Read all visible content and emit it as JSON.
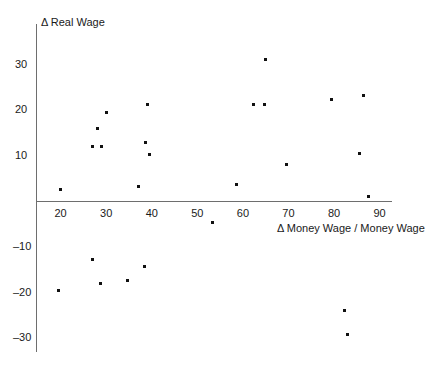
{
  "chart_data": {
    "type": "scatter",
    "title": "",
    "xlabel": "Δ Money Wage / Money Wage",
    "ylabel": "Δ Real Wage",
    "xlim": [
      13,
      95
    ],
    "ylim": [
      -34,
      35
    ],
    "xticks": [
      20,
      30,
      40,
      50,
      60,
      70,
      80,
      90
    ],
    "xtick_labels": [
      "20",
      "30",
      "40",
      "50",
      "60",
      "70",
      "80",
      "90"
    ],
    "yticks": [
      30,
      20,
      10,
      -10,
      -20,
      -30
    ],
    "ytick_labels": [
      "30",
      "20",
      "10",
      "–10",
      "–20",
      "–30"
    ],
    "grid": false,
    "legend": null,
    "marker_color": "#111111",
    "axis_color": "#6e6e6e",
    "points": [
      {
        "x": 20.0,
        "y": 2.7
      },
      {
        "x": 27.0,
        "y": 12.1
      },
      {
        "x": 29.0,
        "y": 12.1
      },
      {
        "x": 28.1,
        "y": 16.1
      },
      {
        "x": 30.1,
        "y": 19.5
      },
      {
        "x": 37.0,
        "y": 3.2
      },
      {
        "x": 38.6,
        "y": 13.0
      },
      {
        "x": 39.5,
        "y": 10.2
      },
      {
        "x": 39.1,
        "y": 21.2
      },
      {
        "x": 53.3,
        "y": -4.7
      },
      {
        "x": 58.6,
        "y": 3.8
      },
      {
        "x": 62.4,
        "y": 21.2
      },
      {
        "x": 64.8,
        "y": 21.2
      },
      {
        "x": 65.0,
        "y": 31.0
      },
      {
        "x": 69.6,
        "y": 8.0
      },
      {
        "x": 79.5,
        "y": 22.4
      },
      {
        "x": 85.6,
        "y": 10.6
      },
      {
        "x": 86.5,
        "y": 23.2
      },
      {
        "x": 87.5,
        "y": 1.2
      },
      {
        "x": 19.5,
        "y": -19.4
      },
      {
        "x": 26.9,
        "y": -12.6
      },
      {
        "x": 28.8,
        "y": -18.0
      },
      {
        "x": 34.6,
        "y": -17.3
      },
      {
        "x": 38.5,
        "y": -14.3
      },
      {
        "x": 82.4,
        "y": -23.9
      },
      {
        "x": 83.0,
        "y": -29.1
      }
    ]
  },
  "axes": {
    "y_title": "Δ Real Wage",
    "x_title": "Δ Money Wage / Money Wage"
  }
}
